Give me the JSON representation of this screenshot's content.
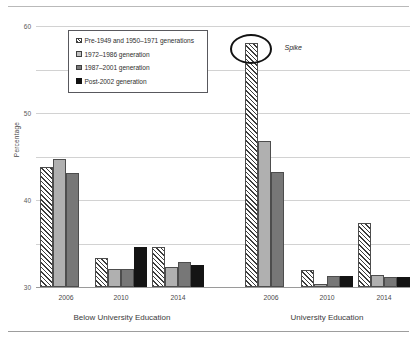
{
  "chart_data": {
    "type": "bar",
    "title": "",
    "xlabel": "",
    "ylabel": "Percentage",
    "ylim": [
      0,
      60
    ],
    "yticks": [
      0,
      10,
      20,
      30,
      40,
      50,
      60
    ],
    "grid": true,
    "legend_position": "upper-left-inside",
    "groups": [
      {
        "name": "Below University Education",
        "categories": [
          "2006",
          "2010",
          "2014"
        ]
      },
      {
        "name": "University Education",
        "categories": [
          "2006",
          "2010",
          "2014"
        ]
      }
    ],
    "categories": [
      "2006",
      "2010",
      "2014",
      "2006",
      "2010",
      "2014"
    ],
    "series": [
      {
        "name": "Pre-1949 and 1950–1971 generations",
        "pattern": "diagonal-hatch",
        "values": [
          27.5,
          6.7,
          9.1,
          56.0,
          3.9,
          14.8
        ]
      },
      {
        "name": "1972–1986 generation",
        "pattern": "light-gray",
        "values": [
          29.5,
          4.2,
          4.6,
          33.5,
          0.6,
          2.8
        ]
      },
      {
        "name": "1987–2001 generation",
        "pattern": "dark-gray",
        "values": [
          26.2,
          4.2,
          5.8,
          26.5,
          2.6,
          2.3
        ]
      },
      {
        "name": "Post-2002 generation",
        "pattern": "black",
        "values": [
          0,
          9.2,
          5.0,
          0,
          2.5,
          2.3
        ]
      }
    ],
    "annotations": [
      {
        "type": "ellipse-callout",
        "label": "Spike",
        "target_group": "University Education",
        "target_category": "2006",
        "target_series": "Pre-1949 and 1950–1971 generations",
        "target_value": 56.0
      }
    ]
  },
  "axis": {
    "yticks": [
      "0",
      "10",
      "20",
      "30",
      "40",
      "50",
      "60"
    ],
    "ylabel": "Percentage"
  },
  "legend": {
    "items": [
      {
        "label": "Pre-1949 and 1950–1971 generations"
      },
      {
        "label": "1972–1986 generation"
      },
      {
        "label": "1987–2001 generation"
      },
      {
        "label": "Post-2002 generation"
      }
    ]
  },
  "groups": [
    {
      "label": "Below University Education",
      "ticks": [
        "2006",
        "2010",
        "2014"
      ]
    },
    {
      "label": "University Education",
      "ticks": [
        "2006",
        "2010",
        "2014"
      ]
    }
  ],
  "annotation": {
    "label": "Spike"
  },
  "colors": {
    "series1": "#ffffff",
    "series2": "#b0b0b0",
    "series3": "#777777",
    "series4": "#141414",
    "grid": "#d2d2d2",
    "axis": "#9a9a9a",
    "annotation": "#121212"
  }
}
